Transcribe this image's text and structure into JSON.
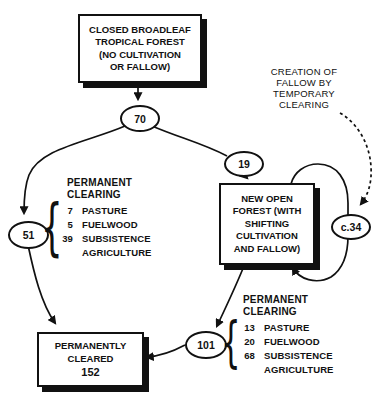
{
  "boxes": {
    "closed_forest": {
      "text": "CLOSED BROADLEAF\nTROPICAL FOREST\n(NO CULTIVATION\nOR FALLOW)"
    },
    "open_forest": {
      "text": "NEW OPEN\nFOREST (WITH\nSHIFTING\nCULTIVATION\nAND FALLOW)"
    },
    "cleared": {
      "text": "PERMANENTLY\nCLEARED",
      "value": "152"
    }
  },
  "flows": {
    "closed_forest_loss": "70",
    "to_open_forest": "19",
    "fallow_cycle": "c.34",
    "left_total": "51",
    "right_total": "101"
  },
  "labels": {
    "creation_of_fallow": "CREATION OF\nFALLOW BY\nTEMPORARY\nCLEARING",
    "brace": "{"
  },
  "left_clearing": {
    "title": "PERMANENT\nCLEARING",
    "items": [
      {
        "value": "7",
        "label": "PASTURE"
      },
      {
        "value": "5",
        "label": "FUELWOOD"
      },
      {
        "value": "39",
        "label": "SUBSISTENCE AGRICULTURE"
      }
    ]
  },
  "right_clearing": {
    "title": "PERMANENT\nCLEARING",
    "items": [
      {
        "value": "13",
        "label": "PASTURE"
      },
      {
        "value": "20",
        "label": "FUELWOOD"
      },
      {
        "value": "68",
        "label": "SUBSISTENCE AGRICULTURE"
      }
    ]
  },
  "colors": {
    "line": "#111111",
    "background": "#ffffff"
  }
}
